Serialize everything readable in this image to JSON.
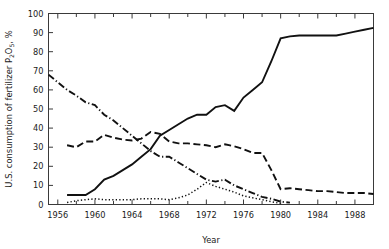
{
  "chart_data": {
    "type": "line",
    "title": "",
    "xlabel": "Year",
    "ylabel": "U.S. consumption of fertilizer P2O5, %",
    "ylabel_parts": {
      "prefix": "U.S. consumption of fertilizer P",
      "sub1": "2",
      "mid": "O",
      "sub2": "5",
      "suffix": ", %"
    },
    "xlim": [
      1955,
      1990
    ],
    "ylim": [
      0,
      100
    ],
    "grid": false,
    "legend": "none",
    "x_ticks_major": [
      1956,
      1960,
      1964,
      1968,
      1972,
      1976,
      1980,
      1984,
      1988
    ],
    "x_tick_labels": [
      "1956",
      "1960",
      "1964",
      "1968",
      "1972",
      "1976",
      "1980",
      "1984",
      "1988"
    ],
    "x_ticks_minor": [
      1958,
      1962,
      1966,
      1970,
      1974,
      1978,
      1982,
      1986,
      1990
    ],
    "y_ticks": [
      0,
      10,
      20,
      30,
      40,
      50,
      60,
      70,
      80,
      90,
      100
    ],
    "y_tick_labels": [
      "0",
      "10",
      "20",
      "30",
      "40",
      "50",
      "60",
      "70",
      "80",
      "90",
      "100"
    ],
    "series": [
      {
        "name": "solid-series",
        "style": "solid",
        "color": "#111111",
        "x": [
          1957,
          1958,
          1959,
          1960,
          1961,
          1962,
          1963,
          1964,
          1965,
          1966,
          1967,
          1968,
          1969,
          1970,
          1971,
          1972,
          1973,
          1974,
          1975,
          1976,
          1977,
          1978,
          1979,
          1980,
          1981,
          1982,
          1983,
          1984,
          1985,
          1986,
          1987,
          1988,
          1989,
          1990
        ],
        "values": [
          5,
          5,
          5,
          8,
          13,
          15,
          18,
          21,
          25,
          29,
          36,
          39,
          42,
          45,
          47,
          47,
          51,
          52,
          49,
          56,
          60,
          64,
          75,
          87,
          88,
          88.5,
          88.5,
          88.5,
          88.5,
          88.5,
          89.5,
          90.5,
          91.5,
          92.5
        ]
      },
      {
        "name": "dashed-series",
        "style": "dashed",
        "color": "#111111",
        "x": [
          1957,
          1958,
          1959,
          1960,
          1961,
          1962,
          1963,
          1964,
          1965,
          1966,
          1967,
          1968,
          1969,
          1970,
          1971,
          1972,
          1973,
          1974,
          1975,
          1976,
          1977,
          1978,
          1979,
          1980,
          1981,
          1982,
          1983,
          1984,
          1985,
          1986,
          1987,
          1988,
          1989,
          1990
        ],
        "values": [
          31,
          30,
          33,
          33,
          36.5,
          35,
          34,
          33.5,
          34.5,
          38,
          37,
          33,
          32,
          32,
          31.5,
          31,
          30,
          31.5,
          30.5,
          29,
          27,
          27,
          18,
          8,
          8.5,
          8,
          7.5,
          7,
          7,
          6.5,
          6,
          6,
          6,
          5.5
        ]
      },
      {
        "name": "dash-dot-series",
        "style": "dashdot",
        "color": "#111111",
        "x": [
          1955,
          1956,
          1957,
          1958,
          1959,
          1960,
          1961,
          1962,
          1963,
          1964,
          1965,
          1966,
          1967,
          1968,
          1969,
          1970,
          1971,
          1972,
          1973,
          1974,
          1975,
          1976,
          1977,
          1978,
          1979,
          1980,
          1981
        ],
        "values": [
          68,
          64,
          60,
          57,
          53.5,
          52,
          47,
          44,
          40,
          36,
          32,
          28,
          25,
          25,
          22,
          19,
          16,
          13,
          12,
          13,
          10,
          8,
          6,
          4,
          3,
          1.5,
          1
        ]
      },
      {
        "name": "dotted-series",
        "style": "dotted",
        "color": "#111111",
        "x": [
          1957,
          1958,
          1959,
          1960,
          1961,
          1962,
          1963,
          1964,
          1965,
          1966,
          1967,
          1968,
          1969,
          1970,
          1971,
          1972,
          1973,
          1974,
          1975,
          1976,
          1977,
          1978,
          1979,
          1980
        ],
        "values": [
          1,
          2,
          2.5,
          3,
          2.5,
          2.5,
          2.5,
          2.5,
          3,
          3,
          3,
          2.5,
          3.5,
          5,
          8,
          11.5,
          9.5,
          8,
          6.5,
          4.5,
          3.5,
          2.5,
          1.5,
          0.5
        ]
      }
    ]
  }
}
